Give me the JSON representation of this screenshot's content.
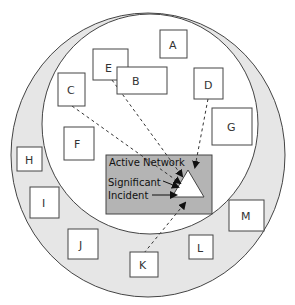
{
  "diagram": {
    "colors": {
      "outer_ring_fill": "#e6e6e6",
      "inner_circle_fill": "#ffffff",
      "network_box_fill": "#b4b4b4",
      "stroke": "#444444",
      "triangle_fill": "#ffffff"
    },
    "outer_nodes": [
      {
        "id": "H",
        "label": "H"
      },
      {
        "id": "I",
        "label": "I"
      },
      {
        "id": "J",
        "label": "J"
      },
      {
        "id": "K",
        "label": "K"
      },
      {
        "id": "L",
        "label": "L"
      },
      {
        "id": "M",
        "label": "M"
      }
    ],
    "inner_nodes": [
      {
        "id": "A",
        "label": "A"
      },
      {
        "id": "B",
        "label": "B"
      },
      {
        "id": "C",
        "label": "C"
      },
      {
        "id": "D",
        "label": "D"
      },
      {
        "id": "E",
        "label": "E"
      },
      {
        "id": "F",
        "label": "F"
      },
      {
        "id": "G",
        "label": "G"
      }
    ],
    "network_box": {
      "title": "Active Network",
      "incident_label_line1": "Significant",
      "incident_label_line2": "Incident"
    },
    "connections": [
      {
        "from": "C",
        "to": "Significant Incident",
        "style": "dashed"
      },
      {
        "from": "E",
        "to": "Significant Incident",
        "style": "dashed"
      },
      {
        "from": "D",
        "to": "Significant Incident",
        "style": "dashed"
      },
      {
        "from": "K",
        "to": "Significant Incident",
        "style": "dashed"
      }
    ]
  }
}
